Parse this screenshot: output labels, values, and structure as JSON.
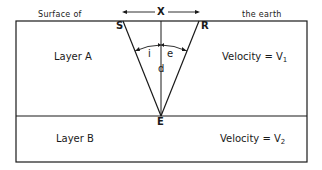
{
  "diagram": {
    "surface_label_left": "Surface of",
    "surface_label_right": "the earth",
    "distance_label": "X",
    "points": {
      "source": "S",
      "receiver": "R",
      "reflection": "E"
    },
    "angles": {
      "incidence": "i",
      "emergence": "e"
    },
    "depth_label": "d",
    "layers": [
      {
        "name": "Layer A",
        "velocity_prefix": "Velocity = V",
        "velocity_sub": "1"
      },
      {
        "name": "Layer B",
        "velocity_prefix": "Velocity = V",
        "velocity_sub": "2"
      }
    ],
    "colors": {
      "line": "#1a1a1a",
      "background": "#ffffff"
    }
  }
}
